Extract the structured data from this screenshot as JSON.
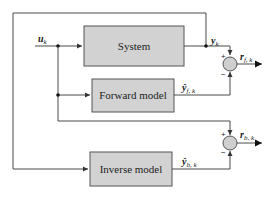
{
  "diagram": {
    "blocks": {
      "system": {
        "label": "System"
      },
      "forward_model": {
        "label": "Forward model"
      },
      "inverse_model": {
        "label": "Inverse model"
      }
    },
    "signals": {
      "input": {
        "symbol": "u",
        "sub": "k"
      },
      "output": {
        "symbol": "y",
        "sub": "k"
      },
      "forward_estimate": {
        "symbol": "ŷ",
        "sub": "f, k"
      },
      "inverse_estimate": {
        "symbol": "ŷ",
        "sub": "b, k"
      },
      "forward_residual": {
        "symbol": "r",
        "sub": "f, k"
      },
      "inverse_residual": {
        "symbol": "r",
        "sub": "b, k"
      }
    },
    "summing_junctions": {
      "forward": {
        "plus": "+",
        "minus": "−"
      },
      "inverse": {
        "plus": "+",
        "minus": "−"
      }
    },
    "colors": {
      "block_fill": "#d2d2d2",
      "wire": "#4a4a4a",
      "sum_fill": "#cfcfcf"
    }
  }
}
